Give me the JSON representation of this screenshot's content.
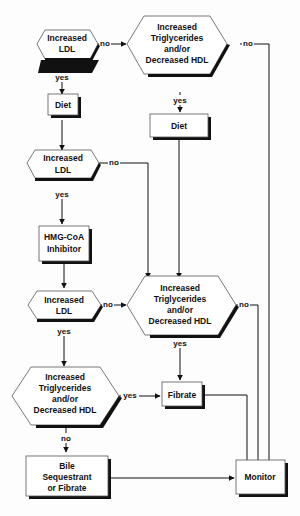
{
  "diagram": {
    "type": "flowchart",
    "nodes": {
      "d1": {
        "lines": [
          "Increased",
          "LDL"
        ]
      },
      "d2": {
        "lines": [
          "Increased",
          "Triglycerides",
          "and/or",
          "Decreased HDL"
        ]
      },
      "p1": {
        "lines": [
          "Diet"
        ]
      },
      "p2": {
        "lines": [
          "Diet"
        ]
      },
      "d3": {
        "lines": [
          "Increased",
          "LDL"
        ]
      },
      "p3": {
        "lines": [
          "HMG-CoA",
          "Inhibitor"
        ]
      },
      "d4": {
        "lines": [
          "Increased",
          "LDL"
        ]
      },
      "d5": {
        "lines": [
          "Increased",
          "Triglycerides",
          "and/or",
          "Decreased HDL"
        ]
      },
      "d6": {
        "lines": [
          "Increased",
          "Triglycerides",
          "and/or",
          "Decreased HDL"
        ]
      },
      "p4": {
        "lines": [
          "Fibrate"
        ]
      },
      "p5": {
        "lines": [
          "Bile",
          "Sequestrant",
          "or Fibrate"
        ]
      },
      "p6": {
        "lines": [
          "Monitor"
        ]
      }
    },
    "edge_labels": {
      "d1_no": "no",
      "d1_yes": "yes",
      "d2_no": "no",
      "d2_yes": "yes",
      "d3_no": "no",
      "d3_yes": "yes",
      "d4_no": "no",
      "d4_yes": "yes",
      "d5_no": "no",
      "d5_yes": "yes",
      "d6_yes": "yes",
      "d6_no": "no"
    },
    "edges": [
      {
        "from": "d1",
        "to": "d2",
        "label": "no"
      },
      {
        "from": "d1",
        "to": "p1",
        "label": "yes"
      },
      {
        "from": "d2",
        "to": "p6",
        "label": "no"
      },
      {
        "from": "d2",
        "to": "p2",
        "label": "yes"
      },
      {
        "from": "p1",
        "to": "d3"
      },
      {
        "from": "d3",
        "to": "d5",
        "label": "no"
      },
      {
        "from": "d3",
        "to": "p3",
        "label": "yes"
      },
      {
        "from": "p2",
        "to": "d5"
      },
      {
        "from": "p3",
        "to": "d4"
      },
      {
        "from": "d4",
        "to": "d5",
        "label": "no"
      },
      {
        "from": "d4",
        "to": "d6",
        "label": "yes"
      },
      {
        "from": "d5",
        "to": "p6",
        "label": "no"
      },
      {
        "from": "d5",
        "to": "p4",
        "label": "yes"
      },
      {
        "from": "d6",
        "to": "p4",
        "label": "yes"
      },
      {
        "from": "d6",
        "to": "p5",
        "label": "no"
      },
      {
        "from": "p4",
        "to": "p6"
      },
      {
        "from": "p5",
        "to": "p6"
      }
    ]
  }
}
